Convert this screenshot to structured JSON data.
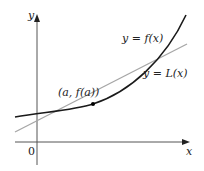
{
  "diagram": {
    "axes": {
      "x_label": "x",
      "y_label": "y",
      "origin_label": "0",
      "axis_color": "#555555"
    },
    "curves": [
      {
        "name": "f",
        "label": "y = f(x)",
        "color": "#1a1a1a"
      },
      {
        "name": "L",
        "label": "y = L(x)",
        "color": "#a6a6a6"
      }
    ],
    "point": {
      "label": "(a, f(a))",
      "color": "#000000"
    }
  }
}
